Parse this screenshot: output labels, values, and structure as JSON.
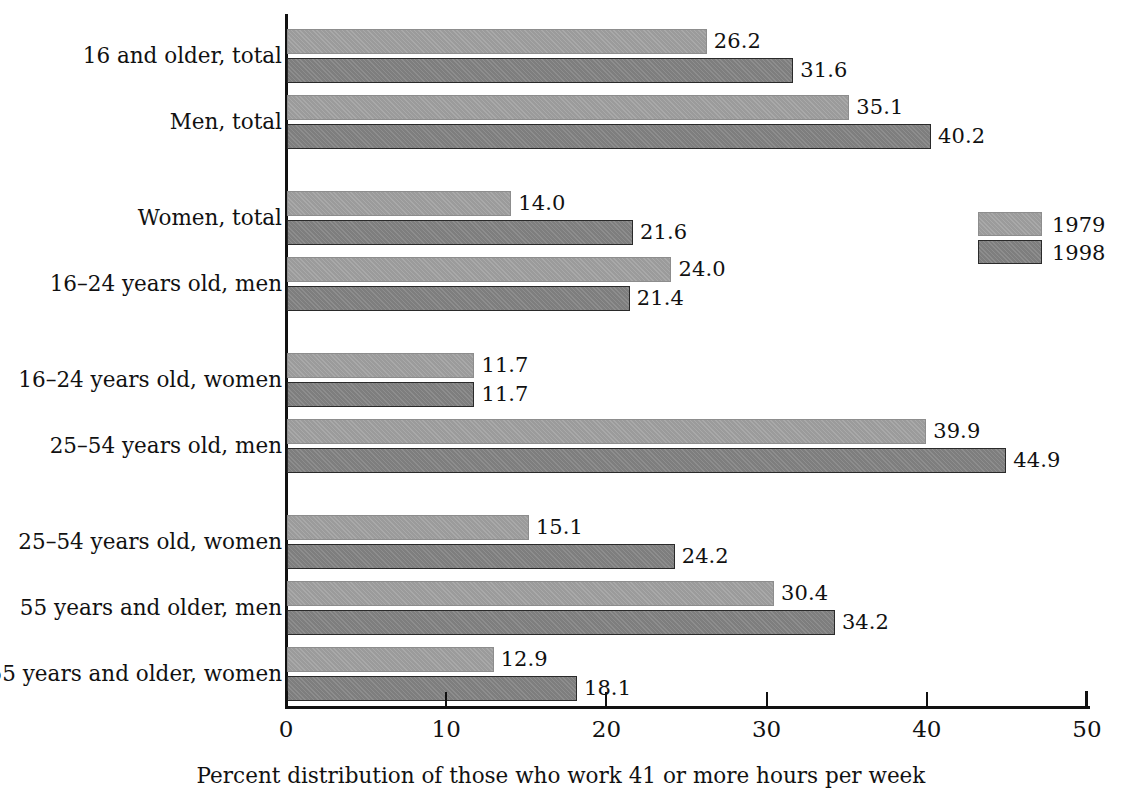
{
  "chart_data": {
    "type": "bar",
    "orientation": "horizontal",
    "title": "",
    "xlabel": "Percent distribution of those who work 41 or more hours per week",
    "ylabel": "",
    "xlim": [
      0,
      50
    ],
    "xticks": [
      0,
      10,
      20,
      30,
      40,
      50
    ],
    "xtick_labels": [
      "0",
      "10",
      "20",
      "30",
      "40",
      "50"
    ],
    "grid": false,
    "legend_position": "right",
    "categories": [
      "16 and older, total",
      "Men, total",
      "Women, total",
      "16–24 years old, men",
      "16–24 years old, women",
      "25–54 years old, men",
      "25–54 years old, women",
      "55 years and older, men",
      "55 years and older, women"
    ],
    "series": [
      {
        "name": "1979",
        "color": "#9b9b9b",
        "values": [
          26.2,
          35.1,
          14.0,
          24.0,
          11.7,
          39.9,
          15.1,
          30.4,
          12.9
        ],
        "value_labels": [
          "26.2",
          "35.1",
          "14.0",
          "24.0",
          "11.7",
          "39.9",
          "15.1",
          "30.4",
          "12.9"
        ]
      },
      {
        "name": "1998",
        "color": "#7e7e7e",
        "values": [
          31.6,
          40.2,
          21.6,
          21.4,
          11.7,
          44.9,
          24.2,
          34.2,
          18.1
        ],
        "value_labels": [
          "31.6",
          "40.2",
          "21.6",
          "21.4",
          "11.7",
          "44.9",
          "24.2",
          "34.2",
          "18.1"
        ]
      }
    ],
    "group_breaks_after": [
      2,
      4,
      6
    ]
  },
  "legend": {
    "entries": [
      {
        "label": "1979"
      },
      {
        "label": "1998"
      }
    ]
  }
}
